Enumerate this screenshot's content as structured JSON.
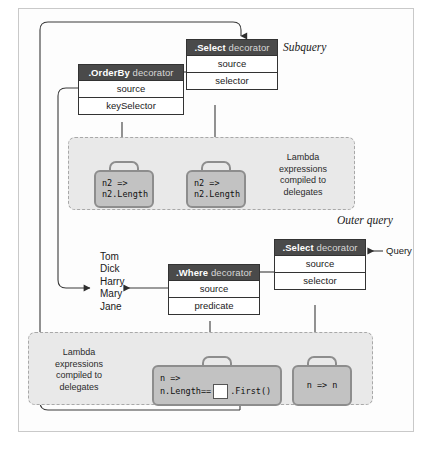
{
  "sections": {
    "subquery_label": "Subquery",
    "outer_query_label": "Outer query",
    "query_label": "Query"
  },
  "decorators": {
    "select_subquery": {
      "name": ".Select",
      "suffix": " decorator",
      "rows": [
        "source",
        "selector"
      ]
    },
    "orderby": {
      "name": ".OrderBy",
      "suffix": " decorator",
      "rows": [
        "source",
        "keySelector"
      ]
    },
    "select_outer": {
      "name": ".Select",
      "suffix": " decorator",
      "rows": [
        "source",
        "selector"
      ]
    },
    "where": {
      "name": ".Where",
      "suffix": " decorator",
      "rows": [
        "source",
        "predicate"
      ]
    }
  },
  "delegate_zones": {
    "subquery": {
      "label": "Lambda\nexpressions\ncompiled to\ndelegates",
      "label_line1": "Lambda",
      "label_line2": "expressions",
      "label_line3": "compiled to",
      "label_line4": "delegates"
    },
    "outer": {
      "label_line1": "Lambda",
      "label_line2": "expressions",
      "label_line3": "compiled to",
      "label_line4": "delegates"
    }
  },
  "lambdas": {
    "keyselector_sub": {
      "line1": "n2 =>",
      "line2": "n2.Length"
    },
    "selector_sub": {
      "line1": "n2 =>",
      "line2": "n2.Length"
    },
    "predicate_outer": {
      "line1": "n =>",
      "line2_pre": "n.Length==",
      "line2_post": ".First()",
      "slot": ""
    },
    "selector_outer": {
      "text": "n => n"
    }
  },
  "source_list": {
    "items": [
      "Tom",
      "Dick",
      "Harry",
      "Mary",
      "Jane"
    ],
    "highlighted": "Harry"
  },
  "colors": {
    "header_bar": "#4a4a4a",
    "box_border": "#333333",
    "briefcase_fill": "#c2c2c2",
    "briefcase_stroke": "#8d8d8d",
    "zone_fill": "#e9e9e9",
    "zone_border": "#a8a8a8",
    "wire": "#3a3a3a",
    "page_border": "#c9c9c9"
  }
}
